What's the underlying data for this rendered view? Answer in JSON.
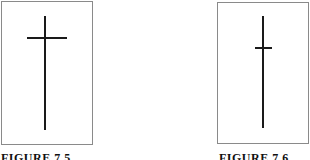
{
  "figures": [
    {
      "caption": "FIGURE 7.5",
      "symbol": "candlestick-cross-high",
      "panel": {
        "left": 1,
        "top": 1,
        "width": 92,
        "height": 144
      },
      "vertical": {
        "left": 44,
        "top": 16,
        "width": 2,
        "height": 114
      },
      "horizontal": {
        "left": 27,
        "top": 37,
        "width": 40,
        "height": 2
      }
    },
    {
      "caption": "FIGURE 7.6",
      "symbol": "candlestick-cross-low",
      "panel": {
        "left": 217,
        "top": 2,
        "width": 92,
        "height": 142
      },
      "vertical": {
        "left": 262,
        "top": 16,
        "width": 2,
        "height": 112
      },
      "horizontal": {
        "left": 255,
        "top": 47,
        "width": 17,
        "height": 2
      }
    }
  ],
  "colors": {
    "stroke": "#1a1a1a",
    "border": "#8a8a8a",
    "background": "#ffffff"
  }
}
